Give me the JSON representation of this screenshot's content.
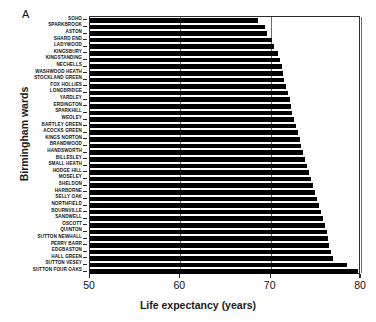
{
  "figure": {
    "panel_label": "A",
    "background_color": "#ffffff",
    "bar_color": "#000000",
    "axis_color": "#2b2b2b",
    "grid_color": "#6b6b6b"
  },
  "chart_data": {
    "type": "bar",
    "orientation": "horizontal",
    "title": "",
    "panel": "A",
    "xlabel": "Life expectancy (years)",
    "ylabel": "Birmingham wards",
    "xlim": [
      50,
      80
    ],
    "xticks": [
      50,
      60,
      70,
      80
    ],
    "xtick_labels": [
      "50",
      "60",
      "70",
      "80"
    ],
    "grid": true,
    "grid_axis": "x",
    "legend": null,
    "legend_position": null,
    "categories": [
      "SOHO",
      "SPARKBROOK",
      "ASTON",
      "SHARD END",
      "LADYWOOD",
      "KINGSBURY",
      "KINGSTANDING",
      "NECHELLS",
      "WASHWOOD HEATH",
      "STOCKLAND GREEN",
      "FOX HOLLIES",
      "LONGBRIDGE",
      "YARDLEY",
      "ERDINGTON",
      "SPARKHILL",
      "WEOLEY",
      "BARTLEY GREEN",
      "ACOCKS GREEN",
      "KINGS NORTON",
      "BRANDWOOD",
      "HANDSWORTH",
      "BILLESLEY",
      "SMALL HEATH",
      "HODGE HILL",
      "MOSELEY",
      "SHELDON",
      "HARBORNE",
      "SELLY OAK",
      "NORTHFIELD",
      "BOURNVILLE",
      "SANDWELL",
      "OSCOTT",
      "QUINTON",
      "SUTTON NEWHALL",
      "PERRY BARR",
      "EDGBASTON",
      "HALL GREEN",
      "SUTTON VESEY",
      "SUTTON FOUR OAKS"
    ],
    "values": [
      68.6,
      69.4,
      69.6,
      70.2,
      70.4,
      70.8,
      71.0,
      71.2,
      71.4,
      71.5,
      71.7,
      71.9,
      72.1,
      72.3,
      72.4,
      72.6,
      72.8,
      73.0,
      73.2,
      73.4,
      73.6,
      73.8,
      74.0,
      74.2,
      74.5,
      74.7,
      74.9,
      75.1,
      75.3,
      75.6,
      75.8,
      76.0,
      76.2,
      76.4,
      76.5,
      76.7,
      76.9,
      78.4,
      79.7
    ],
    "value_unit": "years",
    "sort_order": "ascending"
  }
}
